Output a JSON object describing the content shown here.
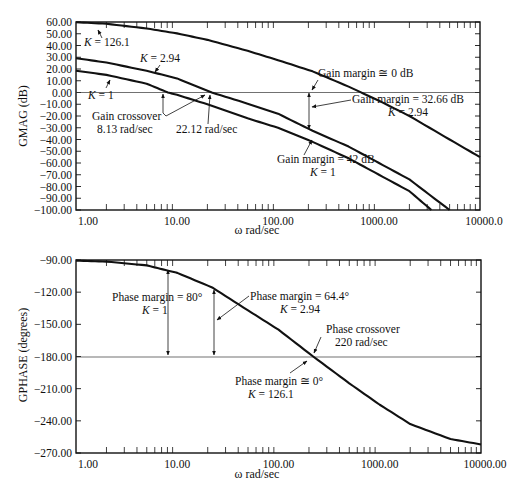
{
  "chart_data": [
    {
      "type": "line",
      "title": "",
      "xlabel": "ω rad/sec",
      "ylabel": "GMAG (dB)",
      "xscale": "log",
      "xlim": [
        1,
        10000
      ],
      "ylim": [
        -100,
        60
      ],
      "grid": false,
      "x_tick_labels": [
        "1.00",
        "10.00",
        "100.00",
        "1000.00",
        "10000.0"
      ],
      "y_tick_labels": [
        "60.00",
        "50.00",
        "40.00",
        "30.00",
        "20.00",
        "10.00",
        "0.00",
        "-10.00",
        "-20.00",
        "-30.00",
        "-40.00",
        "-50.00",
        "-60.00",
        "-70.00",
        "-80.00",
        "-90.00",
        "-100.00"
      ],
      "reference_line": {
        "y": 0
      },
      "series": [
        {
          "name": "K = 126.1",
          "x": [
            1,
            2,
            5,
            10,
            20,
            50,
            100,
            220,
            500,
            1000,
            2000,
            5000,
            10000
          ],
          "values": [
            59.8,
            58.5,
            54.5,
            50.3,
            44.8,
            35.5,
            27.5,
            18,
            5,
            -7,
            -20,
            -40,
            -55
          ]
        },
        {
          "name": "K = 2.94",
          "x": [
            1,
            2,
            5,
            10,
            22.12,
            50,
            100,
            220,
            500,
            1000,
            2000,
            5000
          ],
          "values": [
            29.2,
            25.5,
            18.5,
            12,
            0,
            -9.5,
            -18,
            -32.6,
            -46,
            -60,
            -74,
            -100
          ]
        },
        {
          "name": "K = 1",
          "x": [
            1,
            2,
            5,
            8.13,
            10,
            20,
            50,
            100,
            220,
            500,
            1000,
            2000,
            3300
          ],
          "values": [
            18.5,
            15,
            7.5,
            0,
            -2,
            -10,
            -22,
            -30,
            -42,
            -56,
            -70,
            -84,
            -100
          ]
        }
      ],
      "annotations": [
        {
          "text": "K = 126.1"
        },
        {
          "text": "K = 2.94"
        },
        {
          "text": "K = 1"
        },
        {
          "text": "Gain crossover",
          "sub": "8.13 rad/sec"
        },
        {
          "text": "22.12 rad/sec"
        },
        {
          "text": "Gain margin ≅ 0 dB"
        },
        {
          "text": "Gain margin = 32.66 dB",
          "sub": "K = 2.94"
        },
        {
          "text": "Gain margin = 42 dB",
          "sub": "K = 1"
        }
      ]
    },
    {
      "type": "line",
      "title": "",
      "xlabel": "ω rad/sec",
      "ylabel": "GPHASE (degrees)",
      "xscale": "log",
      "xlim": [
        1,
        10000
      ],
      "ylim": [
        -270,
        -90
      ],
      "grid": false,
      "x_tick_labels": [
        "1.00",
        "10.00",
        "100.00",
        "1000.00",
        "10000.00"
      ],
      "y_tick_labels": [
        "-90.00",
        "-120.00",
        "-150.00",
        "-180.00",
        "-210.00",
        "-240.00",
        "-270.00"
      ],
      "reference_line": {
        "y": -180
      },
      "series": [
        {
          "name": "GPHASE",
          "x": [
            1,
            2,
            5,
            8.13,
            10,
            22.12,
            50,
            100,
            220,
            500,
            1000,
            2000,
            5000,
            10000
          ],
          "values": [
            -90.6,
            -91.5,
            -95,
            -100,
            -102,
            -115.6,
            -137,
            -155,
            -180,
            -205,
            -225,
            -243,
            -257,
            -262
          ]
        }
      ],
      "annotations": [
        {
          "text": "Phase margin = 80°",
          "sub": "K = 1"
        },
        {
          "text": "Phase margin = 64.4°",
          "sub": "K = 2.94"
        },
        {
          "text": "Phase crossover",
          "sub": "220 rad/sec"
        },
        {
          "text": "Phase margin ≅ 0°",
          "sub": "K = 126.1"
        }
      ]
    }
  ],
  "top": {
    "ylabel": "GMAG (dB)",
    "xlabel": "ω rad/sec",
    "yticks": [
      "60.00",
      "50.00",
      "40.00",
      "30.00",
      "20.00",
      "10.00",
      "0.00",
      "−10.00",
      "−20.00",
      "−30.00",
      "−40.00",
      "−50.00",
      "−60.00",
      "−70.00",
      "−80.00",
      "−90.00",
      "−100.00"
    ],
    "xticks": [
      "1.00",
      "10.00",
      "100.00",
      "1000.00",
      "10000.0"
    ],
    "labels": {
      "k126": "K = 126.1",
      "k294": "K = 2.94",
      "k1": "K = 1",
      "gc1": "Gain crossover",
      "gc2": "8.13 rad/sec",
      "gc3": "22.12 rad/sec",
      "gm0": "Gain margin ≅ 0 dB",
      "gm32a": "Gain margin = 32.66 dB",
      "gm32b": "K = 2.94",
      "gm42a": "Gain margin = 42 dB",
      "gm42b": "K = 1"
    }
  },
  "bottom": {
    "ylabel": "GPHASE (degrees)",
    "xlabel": "ω rad/sec",
    "yticks": [
      "−90.00",
      "−120.00",
      "−150.00",
      "−180.00",
      "−210.00",
      "−240.00",
      "−270.00"
    ],
    "xticks": [
      "1.00",
      "10.00",
      "100.00",
      "1000.00",
      "10000.00"
    ],
    "labels": {
      "pm80a": "Phase margin = 80°",
      "pm80b": "K = 1",
      "pm64a": "Phase margin = 64.4°",
      "pm64b": "K = 2.94",
      "pca": "Phase crossover",
      "pcb": "220 rad/sec",
      "pm0a": "Phase margin ≅ 0°",
      "pm0b": "K = 126.1"
    }
  }
}
